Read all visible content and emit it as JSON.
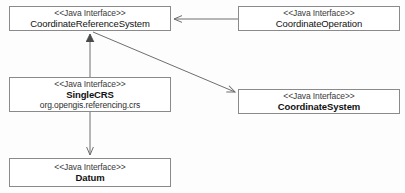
{
  "diagram": {
    "type": "uml-class-diagram",
    "title": "",
    "stereotype_label": "<<Java Interface>>",
    "line_color": "#6e6e6e",
    "box_border_color": "#8a8a8a",
    "box_fill_color": "#ffffff",
    "background_color": "#fdfdfd",
    "classes": [
      {
        "id": "coordinate-reference-system",
        "stereotype": "<<Java Interface>>",
        "name": "CoordinateReferenceSystem",
        "package": "",
        "bold_name": false
      },
      {
        "id": "coordinate-operation",
        "stereotype": "<<Java Interface>>",
        "name": "CoordinateOperation",
        "package": "",
        "bold_name": false
      },
      {
        "id": "single-crs",
        "stereotype": "<<Java Interface>>",
        "name": "SingleCRS",
        "package": "org.opengis.referencing.crs",
        "bold_name": true
      },
      {
        "id": "coordinate-system",
        "stereotype": "<<Java Interface>>",
        "name": "CoordinateSystem",
        "package": "",
        "bold_name": true
      },
      {
        "id": "datum",
        "stereotype": "<<Java Interface>>",
        "name": "Datum",
        "package": "",
        "bold_name": true
      }
    ],
    "relations": [
      {
        "id": "op-to-crs",
        "from": "coordinate-operation",
        "to": "coordinate-reference-system",
        "kind": "association",
        "arrowhead": "open"
      },
      {
        "id": "single-to-crs",
        "from": "single-crs",
        "to": "coordinate-reference-system",
        "kind": "generalization",
        "arrowhead": "closed-triangle"
      },
      {
        "id": "crs-to-cs",
        "from": "coordinate-reference-system",
        "to": "coordinate-system",
        "kind": "association",
        "arrowhead": "open"
      },
      {
        "id": "single-to-datum",
        "from": "single-crs",
        "to": "datum",
        "kind": "association",
        "arrowhead": "open"
      }
    ]
  }
}
